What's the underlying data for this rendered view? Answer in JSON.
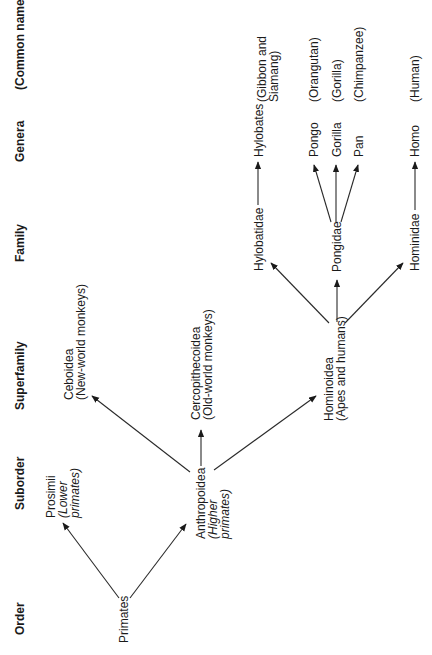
{
  "diagram": {
    "orientation": "rotated-90-ccw",
    "columns": [
      {
        "id": "order",
        "label": "Order"
      },
      {
        "id": "suborder",
        "label": "Suborder"
      },
      {
        "id": "superfamily",
        "label": "Superfamily"
      },
      {
        "id": "family",
        "label": "Family"
      },
      {
        "id": "genera",
        "label": "Genera"
      },
      {
        "id": "common",
        "label": "(Common name)"
      }
    ],
    "nodes": {
      "primates": {
        "lines": [
          "Primates"
        ],
        "level": "order"
      },
      "prosimii": {
        "lines": [
          "Prosimii",
          "(Lower",
          "primates)"
        ],
        "italic": [
          false,
          true,
          true
        ],
        "level": "suborder"
      },
      "anthropoidea": {
        "lines": [
          "Anthropoidea",
          "(Higher",
          "primates)"
        ],
        "italic": [
          false,
          true,
          true
        ],
        "level": "suborder"
      },
      "ceboidea": {
        "lines": [
          "Ceboidea",
          "(New-world monkeys)"
        ],
        "level": "superfamily"
      },
      "cercopithecoidea": {
        "lines": [
          "Cercopithecoidea",
          "(Old-world monkeys)"
        ],
        "level": "superfamily"
      },
      "hominoidea": {
        "lines": [
          "Hominoidea",
          "(Apes and humans)"
        ],
        "level": "superfamily"
      },
      "hylobatidae": {
        "lines": [
          "Hylobatidae"
        ],
        "level": "family"
      },
      "pongidae": {
        "lines": [
          "Pongidae"
        ],
        "level": "family"
      },
      "hominidae": {
        "lines": [
          "Hominidae"
        ],
        "level": "family"
      },
      "hylobates": {
        "lines": [
          "Hylobates"
        ],
        "level": "genera"
      },
      "pongo": {
        "lines": [
          "Pongo"
        ],
        "level": "genera"
      },
      "gorilla": {
        "lines": [
          "Gorilla"
        ],
        "level": "genera"
      },
      "pan": {
        "lines": [
          "Pan"
        ],
        "level": "genera"
      },
      "homo": {
        "lines": [
          "Homo"
        ],
        "level": "genera"
      },
      "common_gibbon": {
        "lines": [
          "(Gibbon and",
          "Siamang)"
        ],
        "level": "common"
      },
      "common_orangutan": {
        "lines": [
          "(Orangutan)"
        ],
        "level": "common"
      },
      "common_gorilla": {
        "lines": [
          "(Gorilla)"
        ],
        "level": "common"
      },
      "common_chimpanzee": {
        "lines": [
          "(Chimpanzee)"
        ],
        "level": "common"
      },
      "common_human": {
        "lines": [
          "(Human)"
        ],
        "level": "common"
      }
    },
    "edges": [
      {
        "from": "primates",
        "to": "prosimii"
      },
      {
        "from": "primates",
        "to": "anthropoidea"
      },
      {
        "from": "anthropoidea",
        "to": "ceboidea"
      },
      {
        "from": "anthropoidea",
        "to": "cercopithecoidea"
      },
      {
        "from": "anthropoidea",
        "to": "hominoidea"
      },
      {
        "from": "hominoidea",
        "to": "hylobatidae"
      },
      {
        "from": "hominoidea",
        "to": "pongidae"
      },
      {
        "from": "hominoidea",
        "to": "hominidae"
      },
      {
        "from": "hylobatidae",
        "to": "hylobates"
      },
      {
        "from": "pongidae",
        "to": "pongo"
      },
      {
        "from": "pongidae",
        "to": "gorilla"
      },
      {
        "from": "pongidae",
        "to": "pan"
      },
      {
        "from": "hominidae",
        "to": "homo"
      }
    ]
  }
}
